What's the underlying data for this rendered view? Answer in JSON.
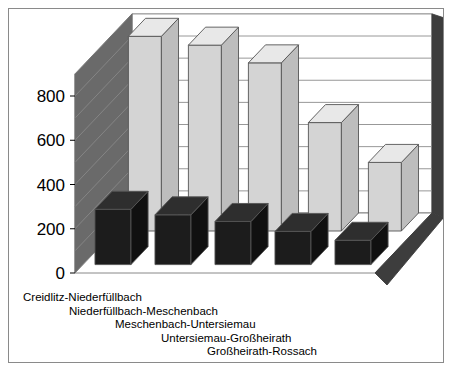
{
  "chart_data": {
    "type": "bar",
    "title": "",
    "subtitle": "",
    "xlabel": "",
    "ylabel": "",
    "ylim": [
      0,
      900
    ],
    "yticks": [
      0,
      200,
      400,
      600,
      800
    ],
    "ytick_labels": [
      "0",
      "200",
      "400",
      "600",
      "800"
    ],
    "minor_gridline_step": 100,
    "grid": true,
    "legend": false,
    "legend_position": "none",
    "projection": "3d-isometric",
    "categories": [
      "Creidlitz-Niederfüllbach",
      "Niederfüllbach-Meschenbach",
      "Meschenbach-Untersiemau",
      "Untersiemau-Großheirath",
      "Großheirath-Rossach"
    ],
    "series": [
      {
        "name": "back-row",
        "color": "#d4d4d4",
        "values": [
          880,
          840,
          760,
          490,
          310
        ]
      },
      {
        "name": "front-row",
        "color": "#1c1c1c",
        "values": [
          250,
          225,
          195,
          150,
          110
        ]
      }
    ]
  },
  "colors": {
    "background": "#ffffff",
    "frame_border": "#8a8a8a",
    "wall_face": "#ffffff",
    "wall_edge": "#6e6e6e",
    "left_panel": "#6a6a6a",
    "floor": "#ffffff",
    "floor_edge": "#7a7a7a",
    "base_dark": "#3d3d3d",
    "bar_light_front": "#d4d4d4",
    "bar_light_top": "#e8e8e8",
    "bar_light_side": "#bdbdbd",
    "bar_dark_front": "#1c1c1c",
    "bar_dark_top": "#2e2e2e",
    "bar_dark_side": "#101010",
    "gridline": "#8c8c8c",
    "text": "#000000"
  }
}
